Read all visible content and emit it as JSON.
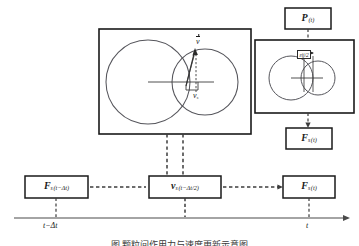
{
  "figure": {
    "caption": "图      颗粒间作用力与速度更新示意图",
    "accent_line_color": "#2a2a2a",
    "dashed_color": "#3d3d3d",
    "circle_color": "#55555a",
    "box_border_color": "#1a1a1a"
  },
  "boxes": {
    "pressure": {
      "symbol": "P",
      "argument": "(t)",
      "full": "P (t)"
    },
    "force_right": {
      "symbol": "F",
      "subscript": "s",
      "argument": "(t)",
      "full": "Fs (t)"
    },
    "force_prev": {
      "symbol": "F",
      "subscript": "s",
      "argument": "(t−Δt)",
      "full": "Fs (t−Δt)"
    },
    "velocity_mid": {
      "symbol": "v",
      "subscript": "s",
      "argument": "(t−Δt/2)",
      "full": "vs (t−Δt/2)"
    },
    "force_now": {
      "symbol": "F",
      "subscript": "s",
      "argument": "(t)",
      "full": "Fs (t)"
    }
  },
  "panels": {
    "main": {
      "name": "particle-collision-panel",
      "velocity_vector_label": "v",
      "velocity_component_label": "v",
      "velocity_component_subscript": "s"
    },
    "detail": {
      "name": "overlap-detail-panel",
      "overlap_tag": "εij/2"
    }
  },
  "axis": {
    "label_left": "t−Δt",
    "label_right": "t",
    "arrow": "right-arrow"
  }
}
